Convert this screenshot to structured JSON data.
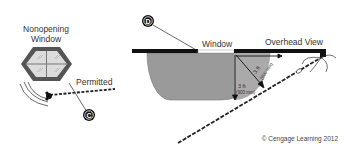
{
  "left_view": {
    "title_line1": "Nonopening",
    "title_line2": "Window",
    "status_label": "Permitted",
    "callout": "C"
  },
  "right_view": {
    "window_label": "Window",
    "view_label": "Overhead View",
    "callout": "D",
    "dimension_vertical": "3 ft",
    "dimension_vertical_metric": "(900 mm)",
    "dimension_diagonal": "3 ft",
    "dimension_diagonal_metric": "(900 mm)"
  },
  "copyright": "© Cengage Learning 2012",
  "colors": {
    "clearance_zone": "#9a9a9a",
    "wall": "#111111",
    "window_frame": "#555555",
    "glass": "#dcdcdc"
  }
}
